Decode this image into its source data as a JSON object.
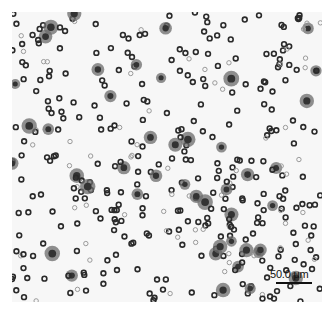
{
  "image": {
    "description": "Grayscale light micrograph of scattered round cells",
    "background_color": "#f7f7f7",
    "cell_color_dark": "#2a2a2a",
    "cell_color_light": "#9a9a9a"
  },
  "scale_bar": {
    "label": "50.0 μm"
  },
  "cells": {
    "count": 420,
    "seed": 7
  }
}
